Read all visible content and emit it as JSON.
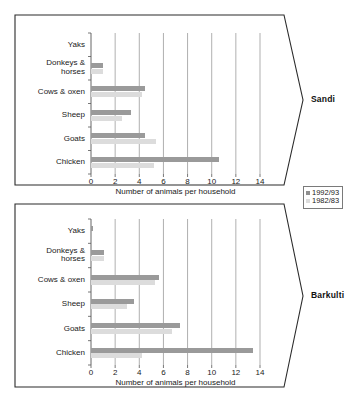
{
  "figure": {
    "panels": [
      {
        "name": "Sandi",
        "label": "Sandi"
      },
      {
        "name": "Barkulti",
        "label": "Barkulti"
      }
    ],
    "legend": {
      "entries": [
        {
          "label": "1992/93",
          "color": "#8f8f8f"
        },
        {
          "label": "1982/83",
          "color": "#dcdcdc"
        }
      ]
    },
    "caption": ""
  },
  "chart_data": [
    {
      "type": "bar",
      "orientation": "horizontal",
      "title": "Sandi",
      "xlabel": "Number of animals per household",
      "ylabel": "",
      "xlim": [
        0,
        14
      ],
      "xticks": [
        0,
        2,
        4,
        6,
        8,
        10,
        12,
        14
      ],
      "xtick_labels": [
        "0",
        "2",
        "4",
        "6",
        "8",
        "10",
        "12",
        "14"
      ],
      "grid": true,
      "legend_position": "outside-right",
      "categories": [
        "Yaks",
        "Donkeys &\nhorses",
        "Cows & oxen",
        "Sheep",
        "Goats",
        "Chicken"
      ],
      "series": [
        {
          "name": "1992/93",
          "color": "#9a9a9a",
          "values": [
            0,
            1.0,
            4.5,
            3.3,
            4.5,
            10.6
          ]
        },
        {
          "name": "1982/83",
          "color": "#dcdcdc",
          "values": [
            0,
            1.0,
            4.2,
            2.6,
            5.4,
            5.2
          ]
        }
      ]
    },
    {
      "type": "bar",
      "orientation": "horizontal",
      "title": "Barkulti",
      "xlabel": "Number of animals per household",
      "ylabel": "",
      "xlim": [
        0,
        14
      ],
      "xticks": [
        0,
        2,
        4,
        6,
        8,
        10,
        12,
        14
      ],
      "xtick_labels": [
        "0",
        "2",
        "4",
        "6",
        "8",
        "10",
        "12",
        "14"
      ],
      "grid": true,
      "legend_position": "outside-right",
      "categories": [
        "Yaks",
        "Donkeys &\nhorses",
        "Cows & oxen",
        "Sheep",
        "Goats",
        "Chicken"
      ],
      "series": [
        {
          "name": "1992/93",
          "color": "#9a9a9a",
          "values": [
            0.15,
            1.1,
            5.6,
            3.6,
            7.4,
            13.4
          ]
        },
        {
          "name": "1982/83",
          "color": "#dcdcdc",
          "values": [
            0,
            1.1,
            5.3,
            3.0,
            6.7,
            4.2
          ]
        }
      ]
    }
  ]
}
